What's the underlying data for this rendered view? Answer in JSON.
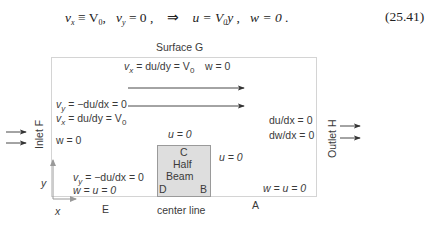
{
  "equation": {
    "lhs1": "v",
    "lhs1_sub": "x",
    "lhs1_rel": " ≡ V",
    "lhs1_rel_sub": "0",
    "lhs2": "v",
    "lhs2_sub": "y",
    "lhs2_rel": " = 0",
    "implies": "⇒",
    "rhs1": "u = V",
    "rhs1_sub": "0",
    "rhs1_tail": "y",
    "rhs2": "w = 0",
    "number": "(25.41)"
  },
  "diagram": {
    "top_surface_label": "Surface G",
    "top_bc": {
      "vx_prefix": "v",
      "vx_sub": "x",
      "vx_rest": " = du/dy = V",
      "vx_v_sub": "0",
      "w": "w = 0"
    },
    "inlet_label": "Inlet F",
    "inlet_bc": {
      "vy_prefix": "v",
      "vy_sub": "y",
      "vy_rest": " = −du/dx = 0",
      "vx_prefix": "v",
      "vx_sub": "x",
      "vx_rest": " = du/dy = V",
      "vx_v_sub": "0",
      "w": "w = 0"
    },
    "outlet_label": "Outlet H",
    "outlet_bc": {
      "line1": "du/dx = 0",
      "line2": "dw/dx = 0"
    },
    "bottom_left_bc": {
      "vy_prefix": "v",
      "vy_sub": "y",
      "vy_rest": " = −du/dx = 0",
      "line2": "w = u = 0"
    },
    "bottom_right_bc": "w = u = 0",
    "beam": {
      "top_bc": "u = 0",
      "right_bc": "u = 0",
      "corner_top": "C",
      "title_line1": "Half",
      "title_line2": "Beam",
      "corner_bottom_left": "D",
      "corner_bottom_right": "B"
    },
    "axes": {
      "x": "x",
      "y": "y"
    },
    "point_E": "E",
    "point_A": "A",
    "center_line": "center line"
  }
}
